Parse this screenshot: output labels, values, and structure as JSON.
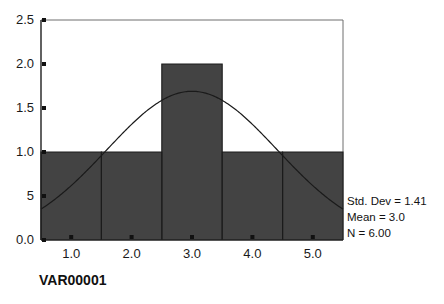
{
  "chart_data": {
    "type": "bar",
    "title": "",
    "subtitle": "",
    "xlabel": "VAR00001",
    "ylabel": "",
    "categories": [
      "1",
      "2",
      "3",
      "4",
      "5"
    ],
    "values": [
      1,
      1,
      2,
      1,
      1
    ],
    "bin_edges": [
      0.5,
      1.5,
      2.5,
      3.5,
      4.5,
      5.5
    ],
    "xlim": [
      0.5,
      5.5
    ],
    "ylim": [
      0.0,
      2.5
    ],
    "grid": false,
    "legend": "none",
    "bar_color": "#434343",
    "bar_edge_color": "#1c1c1c",
    "curve_color": "#1a1a1a",
    "frame_color": "#6e6e6e",
    "axis_color": "#1f1f1f",
    "background_color": "#ffffff",
    "x_ticks": [
      {
        "value": 1.0,
        "label": "1.0"
      },
      {
        "value": 2.0,
        "label": "2.0"
      },
      {
        "value": 3.0,
        "label": "3.0"
      },
      {
        "value": 4.0,
        "label": "4.0"
      },
      {
        "value": 5.0,
        "label": "5.0"
      }
    ],
    "y_ticks": [
      {
        "value": 0.0,
        "label": "0.0"
      },
      {
        "value": 0.5,
        "label": "5"
      },
      {
        "value": 1.0,
        "label": "1.0"
      },
      {
        "value": 1.5,
        "label": "1.5"
      },
      {
        "value": 2.0,
        "label": "2.0"
      },
      {
        "value": 2.5,
        "label": "2.5"
      }
    ],
    "overlay": {
      "type": "normal_curve",
      "mean": 3.0,
      "std_dev": 1.41,
      "n": 6,
      "peak_value": 1.69,
      "endpoint_value": 0.38
    },
    "annotations": {
      "std_dev": "Std. Dev = 1.41",
      "mean": "Mean = 3.0",
      "n": "N = 6.00"
    }
  },
  "axis_title": {
    "x": "VAR00001"
  },
  "stats_box": {
    "line1": "Std. Dev = 1.41",
    "line2": "Mean = 3.0",
    "line3": "N = 6.00"
  }
}
